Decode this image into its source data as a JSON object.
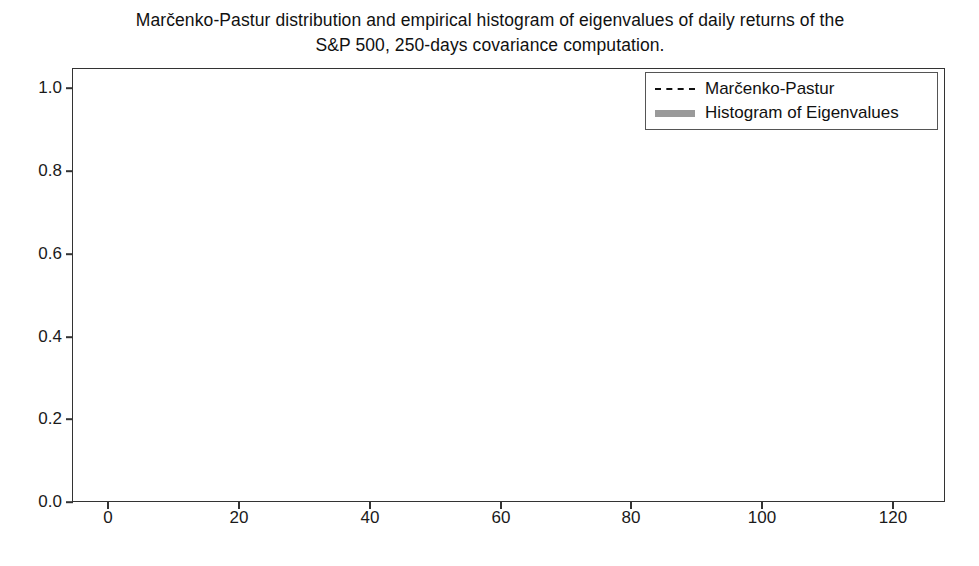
{
  "chart_data": {
    "type": "bar",
    "title": "Marčenko-Pastur distribution and empirical histogram of eigenvalues of daily returns of the\nS&P 500, 250-days covariance computation.",
    "xlabel": "",
    "ylabel": "",
    "xlim": [
      -2.0,
      131.3
    ],
    "ylim": [
      0.0,
      1.05
    ],
    "xticks": [
      0,
      20,
      40,
      60,
      80,
      100,
      120
    ],
    "xticklabels": [
      "0",
      "20",
      "40",
      "60",
      "80",
      "100",
      "120"
    ],
    "yticks": [
      0.0,
      0.2,
      0.4,
      0.6,
      0.8,
      1.0
    ],
    "yticklabels": [
      "0.0",
      "0.2",
      "0.4",
      "0.6",
      "0.8",
      "1.0"
    ],
    "grid": false,
    "legend_position": "upper right",
    "legend": [
      {
        "label": "Marčenko-Pastur",
        "style": "dashed-line",
        "color": "#111111"
      },
      {
        "label": "Histogram of Eigenvalues",
        "style": "filled-patch",
        "color": "#9a9a9a"
      }
    ],
    "series": [
      {
        "name": "Histogram of Eigenvalues",
        "type": "bar",
        "color": "#9a9a9a",
        "bin_width": 0.62,
        "x": [
          0.0,
          0.62,
          1.24,
          1.86,
          2.48,
          3.1,
          3.72,
          4.34,
          4.96,
          5.58,
          6.2,
          6.82,
          7.44,
          8.06
        ],
        "values": [
          1.0,
          0.115,
          0.075,
          0.056,
          0.042,
          0.032,
          0.026,
          0.019,
          0.014,
          0.01,
          0.007,
          0.005,
          0.003,
          0.002
        ]
      },
      {
        "name": "Marčenko-Pastur",
        "type": "line",
        "linestyle": "dashed",
        "color": "#111111",
        "x": [
          0.18,
          0.22,
          0.3,
          0.4,
          0.55,
          0.75,
          1.0,
          1.3,
          1.7,
          2.1,
          2.6,
          3.1,
          3.6,
          4.1,
          4.5,
          4.9,
          5.2,
          5.45,
          5.6,
          5.7
        ],
        "values": [
          0.0,
          0.307,
          0.295,
          0.275,
          0.248,
          0.222,
          0.197,
          0.172,
          0.146,
          0.126,
          0.105,
          0.088,
          0.073,
          0.058,
          0.046,
          0.033,
          0.022,
          0.012,
          0.005,
          0.0
        ]
      }
    ]
  }
}
